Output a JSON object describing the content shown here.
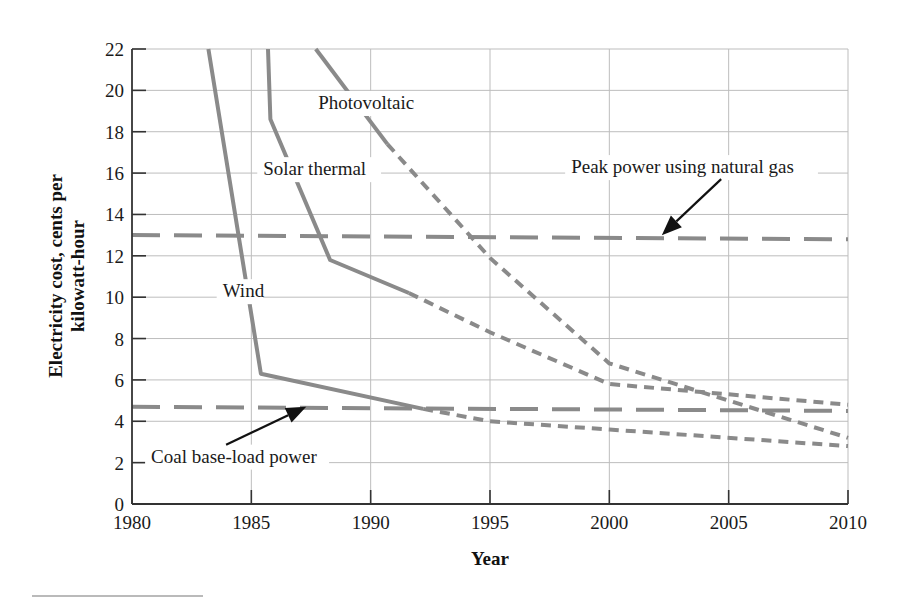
{
  "chart_data": {
    "type": "line",
    "title": "",
    "xlabel": "Year",
    "ylabel": "Electricity cost, cents per kilowatt-hour",
    "ylabel_lines": [
      "Electricity cost, cents per",
      "kilowatt-hour"
    ],
    "xlim": [
      1980,
      2010
    ],
    "ylim": [
      0,
      22
    ],
    "xticks": [
      1980,
      1985,
      1990,
      1995,
      2000,
      2005,
      2010
    ],
    "yticks": [
      0,
      2,
      4,
      6,
      8,
      10,
      12,
      14,
      16,
      18,
      20,
      22
    ],
    "grid": true,
    "legend": "none (inline annotations)",
    "series": [
      {
        "name": "Wind",
        "style": "solid then dotted (projection)",
        "actual": {
          "x": [
            1983.2,
            1985.4,
            1992.2
          ],
          "y": [
            22,
            6.3,
            4.6
          ]
        },
        "projected": {
          "x": [
            1992.2,
            1995,
            2000,
            2010
          ],
          "y": [
            4.6,
            4.0,
            3.6,
            2.8
          ]
        }
      },
      {
        "name": "Solar thermal",
        "style": "solid then dotted (projection)",
        "actual": {
          "x": [
            1985.7,
            1985.8,
            1988.3,
            1991.6
          ],
          "y": [
            22,
            18.6,
            11.8,
            10.2
          ]
        },
        "projected": {
          "x": [
            1991.6,
            1995,
            2000,
            2010
          ],
          "y": [
            10.2,
            8.3,
            5.8,
            4.8
          ]
        }
      },
      {
        "name": "Photovoltaic",
        "style": "solid then dotted (projection)",
        "actual": {
          "x": [
            1987.7,
            1990.7
          ],
          "y": [
            22,
            17.4
          ]
        },
        "projected": {
          "x": [
            1990.7,
            1995,
            2000,
            2010
          ],
          "y": [
            17.4,
            11.9,
            6.8,
            3.2
          ]
        }
      },
      {
        "name": "Peak power using natural gas",
        "style": "long dash reference",
        "x": [
          1980,
          2010
        ],
        "y": [
          13.0,
          12.8
        ]
      },
      {
        "name": "Coal base-load power",
        "style": "long dash reference",
        "x": [
          1980,
          2010
        ],
        "y": [
          4.7,
          4.5
        ]
      }
    ],
    "annotations": [
      {
        "text": "Photovoltaic",
        "x": 1987.8,
        "y": 19.1
      },
      {
        "text": "Solar thermal",
        "x": 1985.5,
        "y": 15.9
      },
      {
        "text": "Wind",
        "x": 1983.8,
        "y": 10.0
      },
      {
        "text": "Peak power using natural gas",
        "x": 1998.4,
        "y": 16.0,
        "arrow_to": [
          2002.2,
          13.0
        ]
      },
      {
        "text": "Coal base-load power",
        "x": 1980.8,
        "y": 2.0,
        "arrow_to": [
          1987.3,
          4.7
        ]
      }
    ],
    "colors": {
      "series": "#8a8a8a",
      "grid": "#bdbdbd",
      "axis": "#333333",
      "arrow": "#111111"
    }
  }
}
